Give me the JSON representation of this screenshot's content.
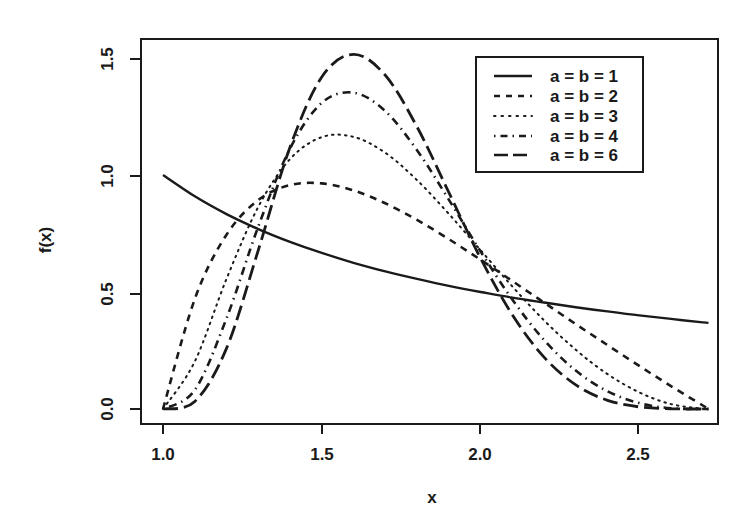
{
  "chart_data": {
    "type": "line",
    "title": "",
    "xlabel": "x",
    "ylabel": "f(x)",
    "xlim": [
      1.0,
      2.718
    ],
    "ylim": [
      0.0,
      1.5
    ],
    "x_ticks": [
      "1.0",
      "1.5",
      "2.0",
      "2.5"
    ],
    "y_ticks": [
      "0.0",
      "0.5",
      "1.0",
      "1.5"
    ],
    "grid": false,
    "legend_position": "top-right",
    "x": [
      1.0,
      1.1,
      1.2,
      1.3,
      1.4,
      1.5,
      1.6,
      1.7,
      1.8,
      1.9,
      2.0,
      2.1,
      2.2,
      2.3,
      2.4,
      2.5,
      2.6,
      2.7,
      2.718
    ],
    "series": [
      {
        "name": "a = b = 1",
        "style": "solid",
        "values": [
          1.0,
          0.909,
          0.833,
          0.769,
          0.714,
          0.667,
          0.625,
          0.588,
          0.556,
          0.526,
          0.5,
          0.476,
          0.455,
          0.435,
          0.417,
          0.4,
          0.385,
          0.37,
          0.368
        ]
      },
      {
        "name": "a = b = 2",
        "style": "dashed",
        "values": [
          0.0,
          0.47,
          0.745,
          0.893,
          0.957,
          0.964,
          0.934,
          0.879,
          0.808,
          0.726,
          0.638,
          0.547,
          0.455,
          0.363,
          0.273,
          0.184,
          0.098,
          0.015,
          0.0
        ]
      },
      {
        "name": "a = b = 3",
        "style": "dotted",
        "values": [
          0.0,
          0.203,
          0.556,
          0.864,
          1.068,
          1.162,
          1.163,
          1.095,
          0.978,
          0.834,
          0.679,
          0.524,
          0.379,
          0.253,
          0.149,
          0.071,
          0.021,
          0.001,
          0.0
        ]
      },
      {
        "name": "a = b = 4",
        "style": "dotdash",
        "values": [
          0.0,
          0.081,
          0.387,
          0.78,
          1.113,
          1.308,
          1.352,
          1.273,
          1.106,
          0.895,
          0.674,
          0.468,
          0.295,
          0.164,
          0.076,
          0.025,
          0.003,
          0.0,
          0.0
        ]
      },
      {
        "name": "a = b = 6",
        "style": "longdash",
        "values": [
          0.0,
          0.032,
          0.259,
          0.679,
          1.119,
          1.419,
          1.516,
          1.426,
          1.206,
          0.926,
          0.645,
          0.403,
          0.222,
          0.103,
          0.037,
          0.009,
          0.001,
          0.0,
          0.0
        ]
      }
    ]
  },
  "colors": {
    "ink": "#1a1a1a",
    "background": "#ffffff"
  }
}
